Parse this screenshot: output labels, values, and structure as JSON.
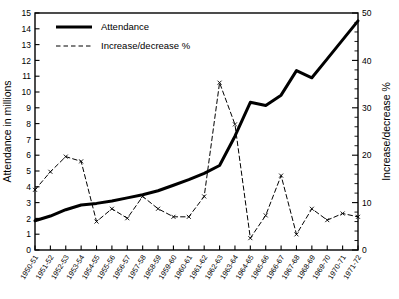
{
  "chart_data": {
    "type": "line",
    "title": "",
    "xlabel": "",
    "ylabel": "Attendance in millions",
    "y2label": "Increase/decrease %",
    "grid": false,
    "legend_position": "top-left",
    "ylim": [
      0,
      15
    ],
    "y2lim": [
      0,
      50
    ],
    "yticks": [
      "0",
      "1",
      "2",
      "3",
      "4",
      "5",
      "6",
      "7",
      "8",
      "9",
      "10",
      "11",
      "12",
      "13",
      "14",
      "15"
    ],
    "y2ticks": [
      "0",
      "10",
      "20",
      "30",
      "40",
      "50"
    ],
    "categories": [
      "1950-51",
      "1951-52",
      "1952-53",
      "1953-54",
      "1954-55",
      "1955-56",
      "1956-57",
      "1957-58",
      "1958-59",
      "1959-60",
      "1960-61",
      "1961-62",
      "1962-63",
      "1963-64",
      "1964-65",
      "1965-66",
      "1966-67",
      "1967-68",
      "1968-69",
      "1969-70",
      "1970-71",
      "1971-72"
    ],
    "series": [
      {
        "name": "Attendance",
        "axis": "left",
        "style": "solid",
        "marker": "none",
        "unit": "millions",
        "values": [
          1.85,
          2.15,
          2.55,
          2.85,
          2.95,
          3.1,
          3.3,
          3.5,
          3.75,
          4.1,
          4.45,
          4.85,
          5.35,
          7.2,
          9.35,
          9.15,
          9.8,
          11.35,
          10.9,
          12.1,
          13.3,
          14.5
        ]
      },
      {
        "name": "Increase/decrease %",
        "axis": "right",
        "style": "dashed",
        "marker": "x",
        "unit": "%",
        "values": [
          12.7,
          16.5,
          19.7,
          18.7,
          6.0,
          8.7,
          6.7,
          11.3,
          8.7,
          7.0,
          7.0,
          11.3,
          35.3,
          26.5,
          2.5,
          7.3,
          15.7,
          3.3,
          8.7,
          6.3,
          7.7,
          7.0
        ]
      }
    ]
  },
  "legend": {
    "items": [
      {
        "label": "Attendance",
        "style": "solid"
      },
      {
        "label": "Increase/decrease %",
        "style": "dashed"
      }
    ]
  },
  "colors": {
    "line": "#000000",
    "axis": "#000000",
    "background": "#ffffff"
  }
}
